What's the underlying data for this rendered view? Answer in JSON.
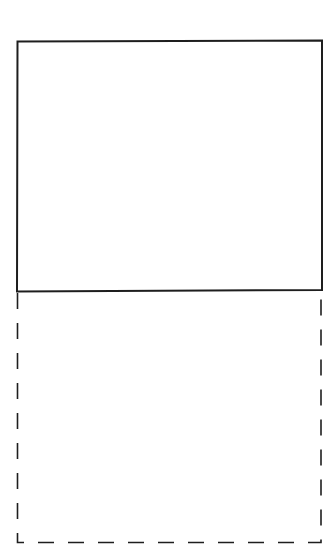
{
  "canvas": {
    "width": 336,
    "height": 557,
    "background": "#ffffff"
  },
  "colors": {
    "stroke": "#1e1e1e"
  },
  "shapes": {
    "solid_rect": {
      "x1": 17,
      "y1": 41,
      "x2": 322,
      "y2": 291,
      "style": "solid",
      "stroke_width": 2
    },
    "dashed_extension": {
      "x1": 17,
      "y1": 291,
      "x2": 321,
      "y2": 543,
      "style": "dashed",
      "stroke_width": 1.6,
      "dash": "16 14"
    }
  }
}
